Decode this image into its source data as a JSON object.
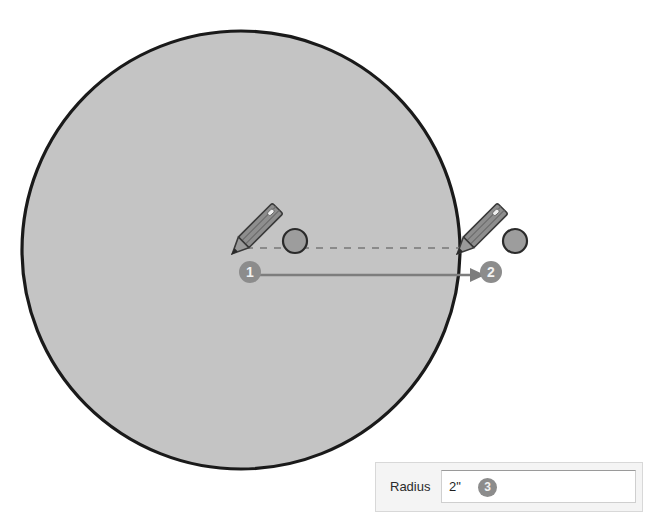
{
  "canvas": {
    "width": 661,
    "height": 525,
    "background": "#ffffff"
  },
  "shape": {
    "name": "circle",
    "fill": "#c4c4c4",
    "stroke": "#1a1a1a",
    "stroke_width": 3,
    "center_x": 241,
    "center_y": 250,
    "radius": 220
  },
  "guides": {
    "dashed_radius_line": {
      "stroke": "#8a8a8a",
      "x1": 248,
      "y1": 248,
      "x2": 470,
      "y2": 248
    },
    "arrow": {
      "stroke": "#7d7d7d",
      "x1": 258,
      "y1": 275,
      "x2": 478,
      "y2": 275
    }
  },
  "cursors": [
    {
      "name": "pencil-cursor-start",
      "tip_x": 238,
      "tip_y": 248,
      "dot_x": 295,
      "dot_y": 241,
      "body_color": "#8e8e8e",
      "outline_color": "#3a3a3a"
    },
    {
      "name": "pencil-cursor-end",
      "tip_x": 463,
      "tip_y": 248,
      "dot_x": 515,
      "dot_y": 241,
      "body_color": "#8e8e8e",
      "outline_color": "#3a3a3a"
    }
  ],
  "steps": [
    {
      "number": "1",
      "description": "click-center-point"
    },
    {
      "number": "2",
      "description": "drag-to-set-radius"
    },
    {
      "number": "3",
      "description": "enter-radius-value"
    }
  ],
  "radius_panel": {
    "label": "Radius",
    "value": "2\"",
    "placeholder": "",
    "badge": "3",
    "panel_background": "#f4f4f4",
    "field_background": "#ffffff"
  },
  "colors": {
    "shape_fill": "#c4c4c4",
    "shape_stroke": "#1a1a1a",
    "badge_fill": "#8c8c8c",
    "badge_text": "#f2f2f2",
    "guide_gray": "#8a8a8a"
  }
}
